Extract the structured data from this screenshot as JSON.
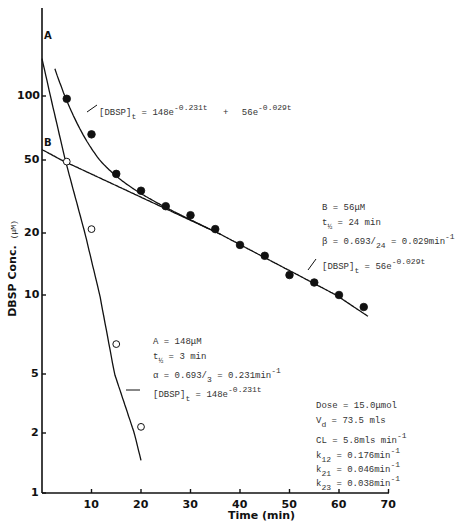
{
  "chart_data": {
    "type": "scatter",
    "title": "",
    "xlabel": "Time (min)",
    "ylabel": "DBSP Conc.",
    "ylabel_unit": "(μM)",
    "yscale": "log",
    "xlim": [
      0,
      70
    ],
    "ylim": [
      1,
      200
    ],
    "grid": false,
    "x_ticks": [
      10,
      20,
      30,
      40,
      50,
      60,
      70
    ],
    "y_ticks": [
      1,
      2,
      5,
      10,
      20,
      50,
      100
    ],
    "series": [
      {
        "name": "Observed DBSP (filled circles)",
        "marker": "filled-circle",
        "x": [
          5,
          10,
          15,
          20,
          25,
          30,
          35,
          40,
          45,
          50,
          55,
          60,
          65
        ],
        "y": [
          97,
          66,
          42,
          34,
          28,
          25,
          21,
          17.5,
          15.5,
          12.5,
          11.5,
          10,
          9
        ]
      },
      {
        "name": "Residuals (open circles)",
        "marker": "open-circle",
        "x": [
          5,
          10,
          15,
          20
        ],
        "y": [
          49,
          21,
          6.5,
          2.2
        ]
      },
      {
        "name": "Biexponential fit",
        "type": "line",
        "equation": "[DBSP]t = 148e^-0.231t + 56e^-0.029t"
      },
      {
        "name": "Line A (alpha phase)",
        "type": "line",
        "equation": "[DBSP]t = 148e^-0.231t",
        "intercept_label": "A"
      },
      {
        "name": "Line B (beta phase)",
        "type": "line",
        "equation": "[DBSP]t = 56e^-0.029t",
        "intercept_label": "B"
      }
    ],
    "annotations": {
      "biexp": {
        "lhs": "[DBSP]",
        "sub": "t",
        "eq": " = 148e",
        "exp1": "-0.231t",
        "plus": "+",
        "term2": "56e",
        "exp2": "-0.029t"
      },
      "beta_block": {
        "line1": "B = 56μM",
        "line2_pre": "t",
        "line2_sub": "½",
        "line2_post": " = 24 min",
        "line3_pre": "β = 0.693/",
        "line3_sub": "24",
        "line3_mid": " = 0.029min",
        "line3_sup": "-1",
        "line4_pre": "[DBSP]",
        "line4_sub": "t",
        "line4_mid": " = 56e",
        "line4_sup": "-0.029t"
      },
      "alpha_block": {
        "line1": "A = 148μM",
        "line2_pre": "t",
        "line2_sub": "½",
        "line2_post": " = 3 min",
        "line3_pre": "α = 0.693/",
        "line3_sub": "3",
        "line3_mid": " = 0.231min",
        "line3_sup": "-1",
        "line4_pre": "[DBSP]",
        "line4_sub": "t",
        "line4_mid": " = 148e",
        "line4_sup": "-0.231t"
      },
      "params_block": {
        "dose": "Dose =  15.0μmol",
        "vd_pre": "V",
        "vd_sub": "d",
        "vd_post": " =  73.5 mls",
        "cl_pre": "CL =  5.8mls min",
        "cl_sup": "-1",
        "k12_pre": "k",
        "k12_sub": "12",
        "k12_post": " = 0.176min",
        "k12_sup": "-1",
        "k21_pre": "k",
        "k21_sub": "21",
        "k21_post": " = 0.046min",
        "k21_sup": "-1",
        "k23_pre": "k",
        "k23_sub": "23",
        "k23_post": " = 0.038min",
        "k23_sup": "-1"
      }
    },
    "labels": {
      "A": "A",
      "B": "B"
    }
  }
}
